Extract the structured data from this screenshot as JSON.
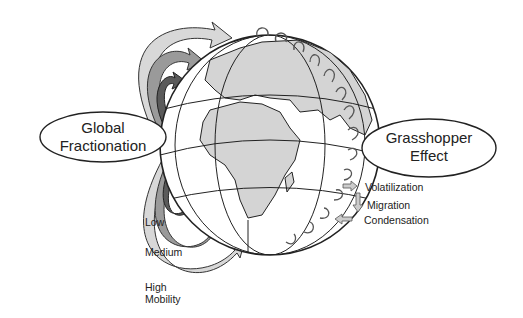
{
  "diagram": {
    "left_label": {
      "line1": "Global",
      "line2": "Fractionation"
    },
    "right_label": {
      "line1": "Grasshopper",
      "line2": "Effect"
    },
    "mobility_labels": {
      "low": "Low",
      "medium": "Medium",
      "high_line1": "High",
      "high_line2": "Mobility"
    },
    "process_labels": {
      "volatilization": "Volatilization",
      "migration": "Migration",
      "condensation": "Condensation"
    },
    "colors": {
      "land": "#d4d4d4",
      "ocean": "#ffffff",
      "outline": "#222222",
      "arrow_low": "#5a5a5a",
      "arrow_medium": "#9a9a9a",
      "arrow_high": "#d8d8d8"
    }
  }
}
